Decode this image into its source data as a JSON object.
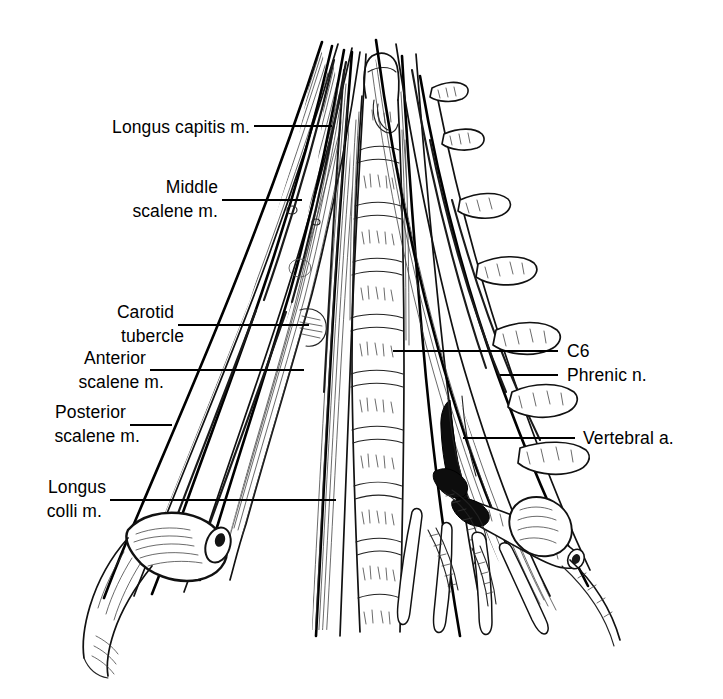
{
  "figure": {
    "kind": "anatomical-line-drawing",
    "technique": "pen-and-ink hatched line illustration",
    "background_color": "#ffffff",
    "ink_color": "#000000",
    "width": 723,
    "height": 699
  },
  "labels": {
    "left": [
      {
        "id": "longus-capitis",
        "text": "Longus capitis m.",
        "lines": [
          "Longus capitis m."
        ],
        "text_x": 88,
        "text_y": 133,
        "leader": {
          "x1": 254,
          "y1": 126,
          "x2": 332,
          "y2": 126
        }
      },
      {
        "id": "middle-scalene",
        "text": "Middle scalene m.",
        "lines": [
          "Middle",
          "scalene m."
        ],
        "text_x": 133,
        "text_y": 193,
        "leader": {
          "x1": 222,
          "y1": 200,
          "x2": 302,
          "y2": 200
        }
      },
      {
        "id": "carotid-tubercle",
        "text": "Carotid tubercle",
        "lines": [
          "Carotid",
          "tubercle"
        ],
        "text_x": 108,
        "text_y": 318,
        "leader": {
          "x1": 178,
          "y1": 325,
          "x2": 309,
          "y2": 325
        }
      },
      {
        "id": "anterior-scalene",
        "text": "Anterior scalene m.",
        "lines": [
          "Anterior",
          "scalene m."
        ],
        "text_x": 68,
        "text_y": 364,
        "leader": {
          "x1": 150,
          "y1": 370,
          "x2": 304,
          "y2": 370
        }
      },
      {
        "id": "posterior-scalene",
        "text": "Posterior scalene m.",
        "lines": [
          "Posterior",
          "scalene m."
        ],
        "text_x": 40,
        "text_y": 418,
        "leader": {
          "x1": 130,
          "y1": 425,
          "x2": 172,
          "y2": 425
        }
      },
      {
        "id": "longus-colli",
        "text": "Longus colli m.",
        "lines": [
          "Longus",
          "colli m."
        ],
        "text_x": 36,
        "text_y": 493,
        "leader": {
          "x1": 110,
          "y1": 500,
          "x2": 336,
          "y2": 500
        }
      }
    ],
    "right": [
      {
        "id": "c6",
        "text": "C6",
        "lines": [
          "C6"
        ],
        "text_x": 567,
        "text_y": 357,
        "leader": {
          "x1": 393,
          "y1": 351,
          "x2": 558,
          "y2": 351
        }
      },
      {
        "id": "phrenic-nerve",
        "text": "Phrenic n.",
        "lines": [
          "Phrenic n."
        ],
        "text_x": 567,
        "text_y": 381,
        "leader": {
          "x1": 500,
          "y1": 375,
          "x2": 558,
          "y2": 375
        }
      },
      {
        "id": "vertebral-artery",
        "text": "Vertebral a.",
        "lines": [
          "Vertebral a."
        ],
        "text_x": 583,
        "text_y": 444,
        "leader": {
          "x1": 463,
          "y1": 438,
          "x2": 575,
          "y2": 438
        }
      }
    ]
  },
  "structures": [
    {
      "id": "longus-capitis-muscle",
      "name": "Longus capitis muscle"
    },
    {
      "id": "middle-scalene-muscle",
      "name": "Middle scalene muscle"
    },
    {
      "id": "anterior-scalene-muscle",
      "name": "Anterior scalene muscle"
    },
    {
      "id": "posterior-scalene-muscle",
      "name": "Posterior scalene muscle"
    },
    {
      "id": "longus-colli-muscle",
      "name": "Longus colli muscle"
    },
    {
      "id": "carotid-tubercle-landmark",
      "name": "Carotid tubercle"
    },
    {
      "id": "c6-vertebral-body",
      "name": "C6 vertebral body"
    },
    {
      "id": "phrenic-nerve",
      "name": "Phrenic nerve"
    },
    {
      "id": "vertebral-artery",
      "name": "Vertebral artery"
    },
    {
      "id": "cervical-vertebral-column",
      "name": "Cervical vertebral bodies"
    },
    {
      "id": "nerve-root-stumps",
      "name": "Cut cervical nerve root stumps"
    },
    {
      "id": "cut-muscle-stump",
      "name": "Cut muscle stump"
    }
  ]
}
